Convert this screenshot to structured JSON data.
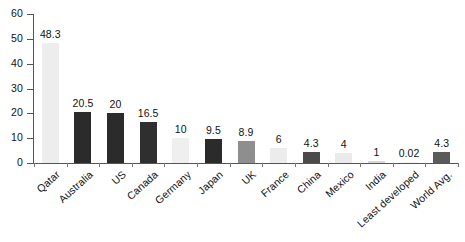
{
  "chart_data": {
    "type": "bar",
    "title": "",
    "subtitle": "",
    "xlabel": "",
    "ylabel": "",
    "ylim": [
      0,
      60
    ],
    "yticks": [
      0,
      10,
      20,
      30,
      40,
      50,
      60
    ],
    "grid": false,
    "legend": "none",
    "categories": [
      "Qatar",
      "Australia",
      "US",
      "Canada",
      "Germany",
      "Japan",
      "UK",
      "France",
      "China",
      "Mexico",
      "India",
      "Least developed",
      "World Avg."
    ],
    "values": [
      48.3,
      20.5,
      20,
      16.5,
      10,
      9.5,
      8.9,
      6,
      4.3,
      4,
      1,
      0.02,
      4.3
    ],
    "value_labels": [
      "48.3",
      "20.5",
      "20",
      "16.5",
      "10",
      "9.5",
      "8.9",
      "6",
      "4.3",
      "4",
      "1",
      "0.02",
      "4.3"
    ],
    "bar_colors": [
      "#ededed",
      "#2b2b2b",
      "#2b2b2b",
      "#2f2f2f",
      "#efefef",
      "#2b2b2b",
      "#8e8e8e",
      "#ececec",
      "#4a4a4a",
      "#eaeaea",
      "#d8d8d8",
      "#f2f2f2",
      "#5a5a5a"
    ],
    "axis_color": "#555555",
    "text_color": "#111111"
  }
}
